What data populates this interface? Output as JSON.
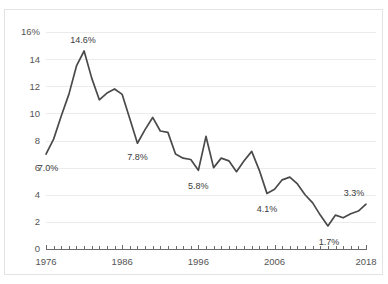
{
  "chart_data": {
    "type": "line",
    "title": "",
    "subtitle": "",
    "xlabel": "",
    "ylabel": "",
    "xlim": [
      1976,
      2018
    ],
    "ylim": [
      0,
      16
    ],
    "grid": true,
    "legend": "none",
    "y_ticks": [
      0,
      2,
      4,
      6,
      8,
      10,
      12,
      14,
      16
    ],
    "y_tick_labels": [
      "0",
      "2",
      "4",
      "6",
      "8",
      "10",
      "12",
      "14",
      "16%"
    ],
    "x_ticks": [
      1976,
      1986,
      1996,
      2006,
      2018
    ],
    "x_tick_labels": [
      "1976",
      "1986",
      "1996",
      "2006",
      "2018"
    ],
    "x_minor_tick_interval": 1,
    "series": [
      {
        "name": "",
        "color": "#4a4a4a",
        "x": [
          1976,
          1977,
          1978,
          1979,
          1980,
          1981,
          1982,
          1983,
          1984,
          1985,
          1986,
          1987,
          1988,
          1989,
          1990,
          1991,
          1992,
          1993,
          1994,
          1995,
          1996,
          1997,
          1998,
          1999,
          2000,
          2001,
          2002,
          2003,
          2004,
          2005,
          2006,
          2007,
          2008,
          2009,
          2010,
          2011,
          2012,
          2013,
          2014,
          2015,
          2016,
          2017,
          2018
        ],
        "values": [
          7.0,
          8.1,
          9.8,
          11.4,
          13.5,
          14.6,
          12.6,
          11.0,
          11.5,
          11.8,
          11.4,
          9.6,
          7.8,
          8.8,
          9.7,
          8.7,
          8.6,
          7.0,
          6.7,
          6.6,
          5.8,
          8.3,
          6.0,
          6.7,
          6.5,
          5.7,
          6.5,
          7.2,
          5.8,
          4.1,
          4.4,
          5.1,
          5.3,
          4.8,
          4.0,
          3.4,
          2.5,
          1.7,
          2.5,
          2.3,
          2.6,
          2.8,
          3.3
        ]
      }
    ],
    "annotations": [
      {
        "text": "7.0%",
        "x": 1976,
        "y": 7.0,
        "dx": 2,
        "dy": 17
      },
      {
        "text": "14.6%",
        "x": 1981,
        "y": 14.6,
        "dx": -1,
        "dy": -8
      },
      {
        "text": "7.8%",
        "x": 1988,
        "y": 7.8,
        "dx": 0,
        "dy": 17
      },
      {
        "text": "5.8%",
        "x": 1996,
        "y": 5.8,
        "dx": 0,
        "dy": 19
      },
      {
        "text": "4.1%",
        "x": 2005,
        "y": 4.1,
        "dx": 0,
        "dy": 19
      },
      {
        "text": "1.7%",
        "x": 2013,
        "y": 1.7,
        "dx": 1,
        "dy": 19
      },
      {
        "text": "3.3%",
        "x": 2018,
        "y": 3.3,
        "dx": -12,
        "dy": -8
      }
    ]
  },
  "colors": {
    "line": "#4a4a4a",
    "grid": "#ececec",
    "axis": "#6b6b6b",
    "text": "#555555",
    "card_border": "#e3e3e3",
    "background": "#ffffff"
  }
}
